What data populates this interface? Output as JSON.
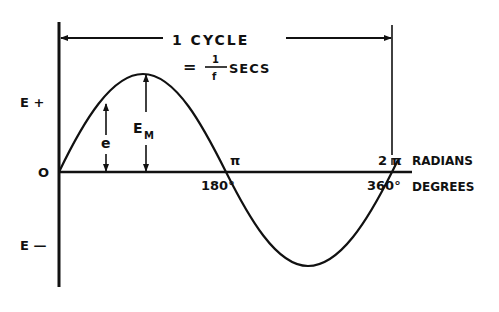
{
  "diagram": {
    "cycle_label": "1 CYCLE",
    "period_eq": "=",
    "period_num": "1",
    "period_den": "f",
    "period_unit": "SECS",
    "y_labels": {
      "pos": "E +",
      "zero": "O",
      "neg": "E —"
    },
    "peak_label": "E",
    "peak_sub": "M",
    "inst_label": "e",
    "x_labels": {
      "pi": "π",
      "deg180": "180°",
      "two_pi": "2 π",
      "radians": "RADIANS",
      "deg360": "360°",
      "degrees": "DEGREES"
    },
    "colors": {
      "ink": "#111111",
      "background": "#ffffff"
    }
  }
}
